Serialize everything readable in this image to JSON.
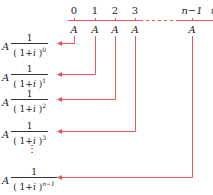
{
  "timeline": {
    "ticks": [
      "0",
      "1",
      "2",
      "3",
      "n−1",
      "n"
    ],
    "payment_label": "A",
    "line_color": "#e2585a"
  },
  "formulas": [
    {
      "coef": "A",
      "numerator": "1",
      "base": "( 1+",
      "var": "i",
      "close": " )",
      "exponent": "0"
    },
    {
      "coef": "A",
      "numerator": "1",
      "base": "( 1+",
      "var": "i",
      "close": " )",
      "exponent": "1"
    },
    {
      "coef": "A",
      "numerator": "1",
      "base": "( 1+",
      "var": "i",
      "close": " )",
      "exponent": "2"
    },
    {
      "coef": "A",
      "numerator": "1",
      "base": "( 1+",
      "var": "i",
      "close": " )",
      "exponent": "3"
    },
    {
      "coef": "A",
      "numerator": "1",
      "base": "( 1+",
      "var": "i",
      "close": " )",
      "exponent": "n−1"
    }
  ],
  "ellipsis": "⋮"
}
